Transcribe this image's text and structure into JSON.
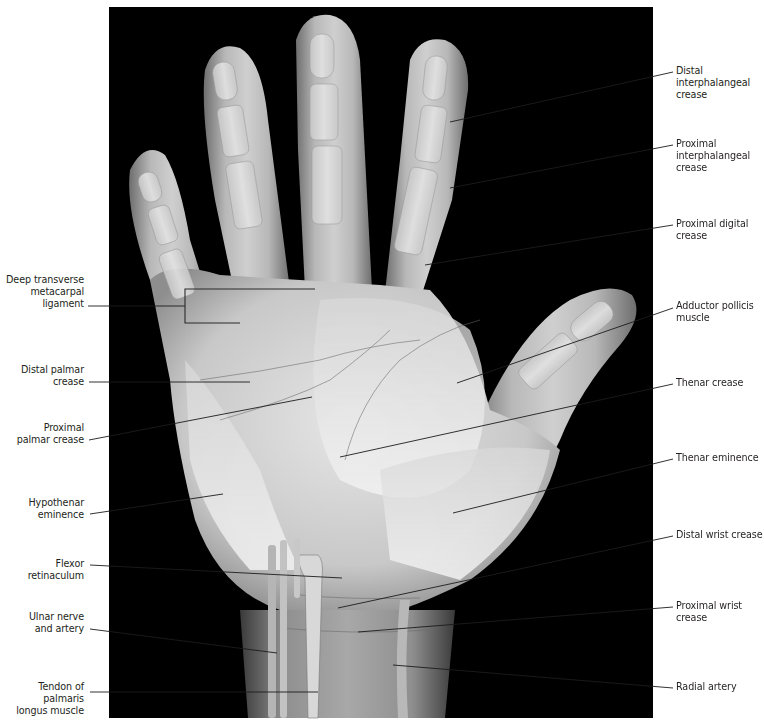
{
  "figure": {
    "background": "#000000",
    "panel": {
      "x": 109,
      "y": 7,
      "width": 544,
      "height": 711
    },
    "leader_color_on_white": "#231f20",
    "leader_color_on_image": "#1a1a1a"
  },
  "labels_left": [
    {
      "id": "deep-transverse-metacarpal-ligament",
      "text": "Deep transverse\nmetacarpal\nligament",
      "x": 0,
      "y": 274,
      "w": 84,
      "line": [
        [
          88,
          306
        ],
        [
          185,
          306
        ]
      ]
    },
    {
      "id": "distal-palmar-crease",
      "text": "Distal palmar\ncrease",
      "x": 0,
      "y": 364,
      "w": 84,
      "line": [
        [
          89,
          382
        ],
        [
          250,
          382
        ]
      ]
    },
    {
      "id": "proximal-palmar-crease",
      "text": "Proximal\npalmar crease",
      "x": 0,
      "y": 422,
      "w": 84,
      "line": [
        [
          89,
          440
        ],
        [
          312,
          397
        ]
      ]
    },
    {
      "id": "hypothenar-eminence",
      "text": "Hypothenar\neminence",
      "x": 0,
      "y": 497,
      "w": 84,
      "line": [
        [
          90,
          514
        ],
        [
          223,
          494
        ]
      ]
    },
    {
      "id": "flexor-retinaculum",
      "text": "Flexor retinaculum",
      "x": 0,
      "y": 558,
      "w": 84,
      "line": [
        [
          90,
          565
        ],
        [
          342,
          578
        ]
      ]
    },
    {
      "id": "ulnar-nerve-and-artery",
      "text": "Ulnar nerve\nand artery",
      "x": 0,
      "y": 611,
      "w": 84,
      "line": [
        [
          90,
          629
        ],
        [
          277,
          653
        ]
      ]
    },
    {
      "id": "tendon-of-palmaris-longus",
      "text": "Tendon of palmaris\nlongus muscle",
      "x": 0,
      "y": 681,
      "w": 84,
      "line": [
        [
          90,
          692
        ],
        [
          318,
          692
        ]
      ]
    }
  ],
  "labels_right": [
    {
      "id": "distal-interphalangeal-crease",
      "text": "Distal\ninterphalangeal\ncrease",
      "x": 676,
      "y": 65,
      "line": [
        [
          673,
          72
        ],
        [
          450,
          122
        ]
      ]
    },
    {
      "id": "proximal-interphalangeal-crease",
      "text": "Proximal\ninterphalangeal\ncrease",
      "x": 676,
      "y": 138,
      "line": [
        [
          673,
          145
        ],
        [
          450,
          188
        ]
      ]
    },
    {
      "id": "proximal-digital-crease",
      "text": "Proximal digital\ncrease",
      "x": 676,
      "y": 218,
      "line": [
        [
          673,
          225
        ],
        [
          425,
          265
        ]
      ]
    },
    {
      "id": "adductor-pollicis-muscle",
      "text": "Adductor pollicis\nmuscle",
      "x": 676,
      "y": 300,
      "line": [
        [
          673,
          308
        ],
        [
          457,
          383
        ]
      ]
    },
    {
      "id": "thenar-crease",
      "text": "Thenar crease",
      "x": 676,
      "y": 377,
      "line": [
        [
          673,
          384
        ],
        [
          340,
          457
        ]
      ]
    },
    {
      "id": "thenar-eminence",
      "text": "Thenar eminence",
      "x": 676,
      "y": 452,
      "line": [
        [
          673,
          459
        ],
        [
          453,
          513
        ]
      ]
    },
    {
      "id": "distal-wrist-crease",
      "text": "Distal wrist crease",
      "x": 676,
      "y": 529,
      "line": [
        [
          673,
          536
        ],
        [
          338,
          608
        ]
      ]
    },
    {
      "id": "proximal-wrist-crease",
      "text": "Proximal wrist\ncrease",
      "x": 676,
      "y": 600,
      "line": [
        [
          673,
          607
        ],
        [
          358,
          632
        ]
      ]
    },
    {
      "id": "radial-artery",
      "text": "Radial artery",
      "x": 676,
      "y": 681,
      "line": [
        [
          673,
          688
        ],
        [
          393,
          665
        ]
      ]
    }
  ],
  "bracket": {
    "x": 185,
    "top": 289,
    "bottom": 323,
    "top_end": 315,
    "bottom_end": 240
  }
}
